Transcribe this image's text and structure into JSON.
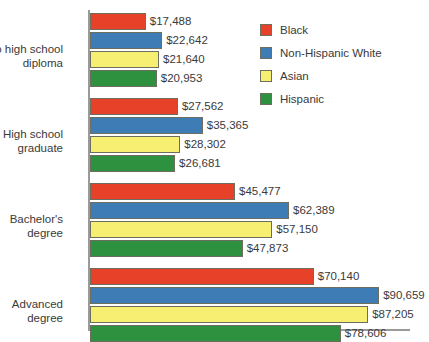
{
  "chart_data": {
    "type": "bar",
    "orientation": "horizontal",
    "title": "",
    "subtitle": "",
    "xlabel": "",
    "ylabel": "",
    "grid": false,
    "legend_position": "top-right",
    "xlim": [
      0,
      100000
    ],
    "categories": [
      "No high school\ndiploma",
      "High school\ngraduate",
      "Bachelor's\ndegree",
      "Advanced\ndegree"
    ],
    "series": [
      {
        "name": "Black",
        "color": "#e8412a",
        "values": [
          17488,
          27562,
          45477,
          70140
        ],
        "labels": [
          "$17,488",
          "$27,562",
          "$45,477",
          "$70,140"
        ]
      },
      {
        "name": "Non-Hispanic White",
        "color": "#3d7cb4",
        "values": [
          22642,
          35365,
          62389,
          90659
        ],
        "labels": [
          "$22,642",
          "$35,365",
          "$62,389",
          "$90,659"
        ]
      },
      {
        "name": "Asian",
        "color": "#f6ef72",
        "values": [
          21640,
          28302,
          57150,
          87205
        ],
        "labels": [
          "$21,640",
          "$28,302",
          "$57,150",
          "$87,205"
        ]
      },
      {
        "name": "Hispanic",
        "color": "#2e9140",
        "values": [
          20953,
          26681,
          47873,
          78606
        ],
        "labels": [
          "$20,953",
          "$26,681",
          "$47,873",
          "$78,606"
        ]
      }
    ]
  }
}
